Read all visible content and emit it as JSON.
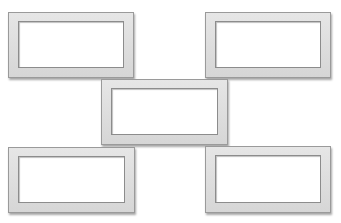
{
  "diagram": {
    "colors": {
      "frame_fill": "#dcdcdc",
      "frame_edge": "#9a9a9a",
      "inner_fill": "#ffffff",
      "background": "#ffffff"
    },
    "frames": [
      {
        "id": "top-left",
        "x": 8,
        "y": 12,
        "w": 126,
        "h": 66
      },
      {
        "id": "top-right",
        "x": 205,
        "y": 12,
        "w": 126,
        "h": 66
      },
      {
        "id": "center",
        "x": 101,
        "y": 79,
        "w": 127,
        "h": 66
      },
      {
        "id": "bottom-left",
        "x": 8,
        "y": 147,
        "w": 127,
        "h": 66
      },
      {
        "id": "bottom-right",
        "x": 205,
        "y": 146,
        "w": 126,
        "h": 67
      }
    ]
  }
}
